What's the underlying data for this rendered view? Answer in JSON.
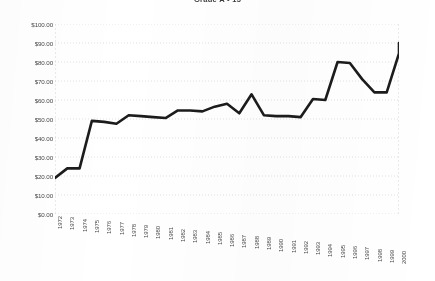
{
  "chart": {
    "title": "Grade A - 15",
    "title_note": "clipped-at-top-edge"
  },
  "chart_data": {
    "type": "line",
    "title": "Grade A - 15",
    "xlabel": "",
    "ylabel": "",
    "grid": true,
    "legend": false,
    "ylim": [
      0,
      100
    ],
    "ytick_labels": [
      "$100.00",
      "$90.00",
      "$80.00",
      "$70.00",
      "$60.00",
      "$50.00",
      "$40.00",
      "$30.00",
      "$20.00",
      "$10.00",
      "$0.00"
    ],
    "ytick_values": [
      100,
      90,
      80,
      70,
      60,
      50,
      40,
      30,
      20,
      10,
      0
    ],
    "categories": [
      "1972",
      "1973",
      "1974",
      "1975",
      "1976",
      "1977",
      "1978",
      "1979",
      "1980",
      "1981",
      "1982",
      "1983",
      "1984",
      "1985",
      "1986",
      "1987",
      "1988",
      "1989",
      "1990",
      "1991",
      "1992",
      "1993",
      "1994",
      "1995",
      "1996",
      "1997",
      "1998",
      "1999",
      "2000"
    ],
    "values": [
      19.0,
      24.0,
      24.0,
      49.0,
      48.5,
      47.5,
      52.0,
      51.5,
      51.0,
      50.5,
      54.5,
      54.5,
      54.0,
      56.5,
      58.0,
      53.0,
      63.0,
      52.0,
      51.5,
      51.5,
      51.0,
      60.5,
      60.0,
      80.0,
      79.5,
      71.0,
      64.0,
      64.0,
      84.5
    ],
    "series_color": "#1c1c1c",
    "line_width": 2.6,
    "end_point_value": 90.0
  }
}
